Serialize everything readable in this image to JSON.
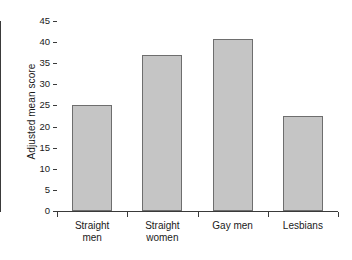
{
  "chart_data": {
    "type": "bar",
    "title": "",
    "subtitle": "",
    "xlabel": "",
    "ylabel": "Adjusted mean score",
    "categories": [
      "Straight men",
      "Straight women",
      "Gay men",
      "Lesbians"
    ],
    "category_lines": [
      [
        "Straight",
        "men"
      ],
      [
        "Straight",
        "women"
      ],
      [
        "Gay men"
      ],
      [
        "Lesbians"
      ]
    ],
    "values": [
      25,
      37,
      40.8,
      22.6
    ],
    "ylim": [
      0,
      45
    ],
    "ytick_values": [
      0,
      5,
      10,
      15,
      20,
      25,
      30,
      35,
      40,
      45
    ],
    "ytick_labels": [
      "0",
      "5",
      "10",
      "15",
      "20",
      "25",
      "30",
      "35",
      "40",
      "45"
    ],
    "grid": false,
    "legend": null,
    "legend_position": "none",
    "bar_fill_color": "#c5c5c5",
    "bar_edge_color": "#6e6e6e",
    "axis_color": "#3a3a3a",
    "background_color": "#ffffff"
  }
}
